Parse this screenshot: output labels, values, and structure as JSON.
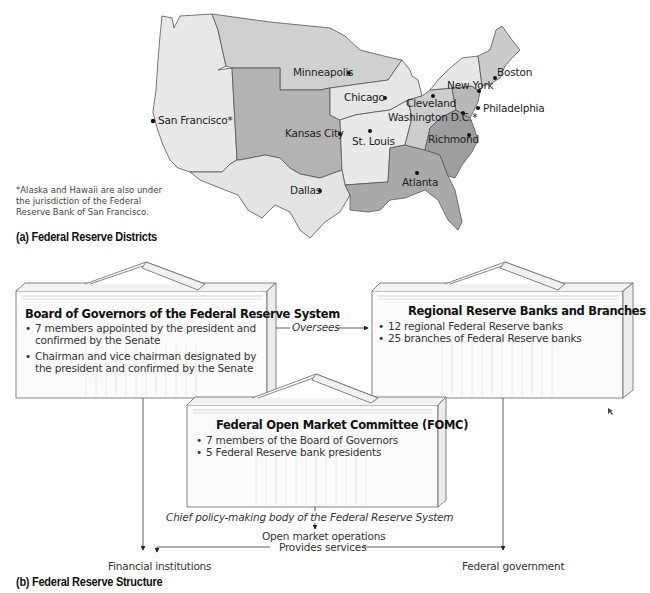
{
  "map": {
    "caption": "(a)  Federal Reserve Districts",
    "footnote": "*Alaska and Hawaii are also under the jurisdiction of the Federal Reserve Bank of San Francisco.",
    "cities": [
      {
        "name": "Minneapolis",
        "x": 293,
        "y": 66
      },
      {
        "name": "Chicago",
        "x": 344,
        "y": 94
      },
      {
        "name": "San Francisco*",
        "x": 158,
        "y": 116
      },
      {
        "name": "Kansas City",
        "x": 285,
        "y": 127
      },
      {
        "name": "St. Louis",
        "x": 354,
        "y": 134
      },
      {
        "name": "Cleveland",
        "x": 406,
        "y": 98
      },
      {
        "name": "Washington D.C.*",
        "x": 388,
        "y": 112
      },
      {
        "name": "New York",
        "x": 447,
        "y": 81
      },
      {
        "name": "Boston",
        "x": 497,
        "y": 67
      },
      {
        "name": "Philadelphia",
        "x": 484,
        "y": 103
      },
      {
        "name": "Richmond",
        "x": 428,
        "y": 133
      },
      {
        "name": "Atlanta",
        "x": 400,
        "y": 177
      },
      {
        "name": "Dallas",
        "x": 290,
        "y": 183
      }
    ],
    "colors": {
      "light": "#e6e6e6",
      "lighter": "#ededed",
      "medium": "#cfcfcf",
      "mid_dark": "#b3b3b3",
      "dark": "#a3a3a3",
      "border": "#555555"
    }
  },
  "structure": {
    "caption": "(b)  Federal Reserve Structure",
    "board": {
      "title": "Board of Governors of the Federal Reserve System",
      "items": [
        "7 members appointed by the president and confirmed by the Senate",
        "Chairman and vice chairman designated by the president and confirmed by the Senate"
      ]
    },
    "regional": {
      "title": "Regional Reserve Banks and Branches",
      "items": [
        "12 regional Federal Reserve banks",
        "25 branches of Federal Reserve banks"
      ]
    },
    "fomc": {
      "title": "Federal Open Market Committee (FOMC)",
      "items": [
        "7 members of the Board of Governors",
        "5 Federal Reserve bank presidents"
      ],
      "subtitle": "Chief policy-making body of the Federal Reserve System"
    },
    "flows": {
      "oversees": "Oversees",
      "open_market": "Open market operations",
      "provides_services": "Provides services",
      "financial_institutions": "Financial institutions",
      "federal_government": "Federal government"
    }
  }
}
